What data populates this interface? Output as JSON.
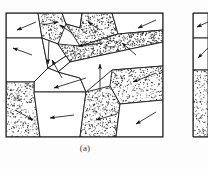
{
  "figure": {
    "kind": "grain-microstructure-schematic",
    "caption": "(a)",
    "colors": {
      "background": "#fdfdfd",
      "stroke": "#1a1a1a",
      "stipple": "#2b2b2b",
      "panel_fill": "#ffffff",
      "caption": "#3a3a3a"
    },
    "panels": [
      {
        "id": "a",
        "label": "(a)",
        "frame": {
          "x": 6,
          "y": 13,
          "width": 157,
          "height": 124
        },
        "grain_count": 16,
        "arrow_count": 16
      },
      {
        "id": "b",
        "label": "",
        "frame": {
          "x": 193,
          "y": 13,
          "width": 15,
          "height": 124
        },
        "grain_count": 3,
        "arrow_count": 2,
        "clipped": true
      }
    ],
    "legend": {
      "stippled_meaning": "stippled grain",
      "clear_meaning": "clear grain",
      "arrow_meaning": "slip / growth direction"
    }
  },
  "chart_data": {
    "type": "diagram",
    "title": "(a)",
    "xlabel": "",
    "ylabel": "",
    "panel_a": {
      "frame": [
        6,
        13,
        163,
        137
      ],
      "grains": [
        {
          "id": "g1",
          "fill": "clear",
          "points": "6,13 38,13 42,38 6,38"
        },
        {
          "id": "g2",
          "fill": "stippled",
          "points": "38,13 62,13 66,24 58,44 42,38"
        },
        {
          "id": "g3",
          "fill": "clear",
          "points": "62,13 82,13 80,28 66,24"
        },
        {
          "id": "g4",
          "fill": "stippled",
          "points": "82,13 112,13 118,34 80,46 66,24 80,28"
        },
        {
          "id": "g5",
          "fill": "clear",
          "points": "112,13 163,13 163,30 118,34"
        },
        {
          "id": "g6",
          "fill": "clear",
          "points": "6,38 42,38 48,68 34,82 6,82"
        },
        {
          "id": "g7",
          "fill": "clear",
          "points": "42,38 58,44 66,56 48,68"
        },
        {
          "id": "g8",
          "fill": "stippled",
          "points": "58,44 80,46 118,34 163,30 163,42 70,62 66,56"
        },
        {
          "id": "g9",
          "fill": "clear",
          "points": "48,68 66,56 70,62 58,72"
        },
        {
          "id": "g10",
          "fill": "clear",
          "points": "34,82 48,68 58,72 80,78 86,92 34,92"
        },
        {
          "id": "g11",
          "fill": "clear",
          "points": "70,62 163,42 163,66 112,70 86,92 80,78 58,72"
        },
        {
          "id": "g12",
          "fill": "stippled",
          "points": "163,66 163,100 120,104 110,86 112,70"
        },
        {
          "id": "g13",
          "fill": "stippled",
          "points": "6,82 34,82 34,92 40,137 6,137"
        },
        {
          "id": "g14",
          "fill": "clear",
          "points": "34,92 86,92 80,137 40,137"
        },
        {
          "id": "g15",
          "fill": "stippled",
          "points": "86,92 110,86 120,104 116,137 80,137"
        },
        {
          "id": "g16",
          "fill": "clear",
          "points": "120,104 163,100 163,137 116,137"
        }
      ],
      "arrows": [
        {
          "id": "a1",
          "from": [
            36,
            22
          ],
          "to": [
            17,
            30
          ],
          "region": "g1"
        },
        {
          "id": "a2",
          "from": [
            42,
            25
          ],
          "to": [
            58,
            22
          ],
          "region": "g2"
        },
        {
          "id": "a3",
          "from": [
            72,
            33
          ],
          "to": [
            60,
            25
          ],
          "region": "g3"
        },
        {
          "id": "a4",
          "from": [
            100,
            30
          ],
          "to": [
            88,
            22
          ],
          "region": "g4"
        },
        {
          "id": "a5",
          "from": [
            156,
            20
          ],
          "to": [
            138,
            28
          ],
          "region": "g5"
        },
        {
          "id": "a6",
          "from": [
            32,
            55
          ],
          "to": [
            13,
            48
          ],
          "region": "g6"
        },
        {
          "id": "a7",
          "from": [
            49,
            40
          ],
          "to": [
            48,
            64
          ],
          "region": "g6"
        },
        {
          "id": "a8",
          "from": [
            103,
            43
          ],
          "to": [
            78,
            46
          ],
          "region": "g8"
        },
        {
          "id": "a9",
          "from": [
            62,
            78
          ],
          "to": [
            52,
            60
          ],
          "region": "g9"
        },
        {
          "id": "a10",
          "from": [
            86,
            78
          ],
          "to": [
            54,
            88
          ],
          "region": "g10"
        },
        {
          "id": "a11",
          "from": [
            136,
            55
          ],
          "to": [
            122,
            43
          ],
          "region": "g11"
        },
        {
          "id": "a12",
          "from": [
            100,
            92
          ],
          "to": [
            100,
            64
          ],
          "region": "g11"
        },
        {
          "id": "a13",
          "from": [
            156,
            73
          ],
          "to": [
            133,
            82
          ],
          "region": "g12"
        },
        {
          "id": "a14",
          "from": [
            15,
            110
          ],
          "to": [
            33,
            120
          ],
          "region": "g13"
        },
        {
          "id": "a15",
          "from": [
            74,
            115
          ],
          "to": [
            50,
            118
          ],
          "region": "g14"
        },
        {
          "id": "a16",
          "from": [
            117,
            114
          ],
          "to": [
            96,
            120
          ],
          "region": "g15"
        },
        {
          "id": "a17",
          "from": [
            156,
            112
          ],
          "to": [
            136,
            124
          ],
          "region": "g16"
        }
      ]
    },
    "panel_b": {
      "frame": [
        193,
        13,
        208,
        137
      ],
      "grains": [
        {
          "id": "h1",
          "fill": "clear",
          "points": "193,13 208,13 208,38 193,38"
        },
        {
          "id": "h2",
          "fill": "clear",
          "points": "193,38 208,38 208,70 193,70"
        },
        {
          "id": "h3",
          "fill": "stippled",
          "points": "193,70 208,70 208,137 193,137"
        }
      ],
      "arrows": [
        {
          "id": "b1",
          "from": [
            208,
            22
          ],
          "to": [
            197,
            27
          ]
        },
        {
          "id": "b2",
          "from": [
            208,
            48
          ],
          "to": [
            198,
            58
          ]
        }
      ]
    },
    "grid": false,
    "legend_position": "none"
  }
}
